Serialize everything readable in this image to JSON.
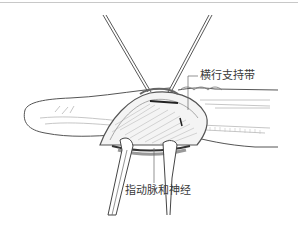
{
  "figure": {
    "labels": {
      "transverse_retinacular_ligament": "横行支持带",
      "digital_artery_and_nerve": "指动脉和神经"
    },
    "colors": {
      "outline": "#555555",
      "light_detail": "#b8b8b8",
      "background": "#ffffff",
      "rule": "#c8c8c8"
    }
  }
}
